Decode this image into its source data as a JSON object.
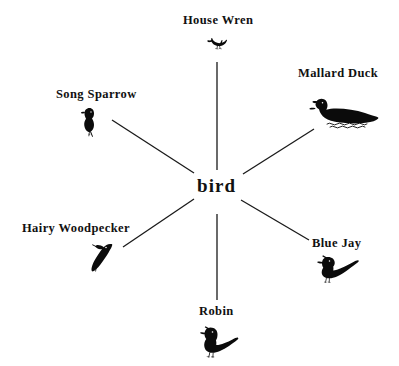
{
  "diagram": {
    "type": "semantic-web-radial",
    "center": {
      "label": "bird",
      "x": 218,
      "y": 186
    },
    "background_color": "#ffffff",
    "ink_color": "#0b0b0b",
    "nodes": [
      {
        "id": "house-wren",
        "label": "House Wren",
        "icon": "house-wren-bird-silhouette",
        "label_x": 183,
        "label_y": 14,
        "icon_x": 207,
        "icon_y": 36,
        "position": "top",
        "spoke": {
          "x1": 217,
          "y1": 62,
          "x2": 217,
          "y2": 170
        }
      },
      {
        "id": "mallard-duck",
        "label": "Mallard Duck",
        "icon": "mallard-duck-silhouette",
        "label_x": 298,
        "label_y": 67,
        "icon_x": 309,
        "icon_y": 95,
        "position": "top-right",
        "spoke": {
          "x1": 243,
          "y1": 174,
          "x2": 314,
          "y2": 129
        }
      },
      {
        "id": "song-sparrow",
        "label": "Song Sparrow",
        "icon": "song-sparrow-silhouette",
        "label_x": 56,
        "label_y": 88,
        "icon_x": 80,
        "icon_y": 107,
        "position": "top-left",
        "spoke": {
          "x1": 112,
          "y1": 120,
          "x2": 194,
          "y2": 173
        }
      },
      {
        "id": "hairy-woodpecker",
        "label": "Hairy Woodpecker",
        "icon": "hairy-woodpecker-silhouette",
        "label_x": 22,
        "label_y": 222,
        "icon_x": 86,
        "icon_y": 242,
        "position": "bottom-left",
        "spoke": {
          "x1": 123,
          "y1": 247,
          "x2": 194,
          "y2": 199
        }
      },
      {
        "id": "blue-jay",
        "label": "Blue Jay",
        "icon": "blue-jay-silhouette",
        "label_x": 312,
        "label_y": 237,
        "icon_x": 316,
        "icon_y": 255,
        "position": "bottom-right",
        "spoke": {
          "x1": 241,
          "y1": 200,
          "x2": 309,
          "y2": 240
        }
      },
      {
        "id": "robin",
        "label": "Robin",
        "icon": "robin-silhouette",
        "label_x": 199,
        "label_y": 305,
        "icon_x": 200,
        "icon_y": 326,
        "position": "bottom",
        "spoke": {
          "x1": 217,
          "y1": 214,
          "x2": 217,
          "y2": 300
        }
      }
    ]
  }
}
